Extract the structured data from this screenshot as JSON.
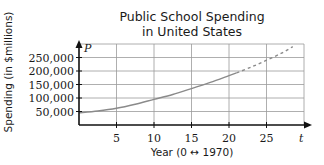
{
  "chart_data": {
    "type": "line",
    "title": "Public School Spending in United States",
    "title_lines": [
      "Public School Spending",
      "in United States"
    ],
    "xlabel": "Year (0 ↔ 1970)",
    "ylabel": "Spending (in $millions)",
    "x_var": "t",
    "y_var": "P",
    "xlim": [
      0,
      30
    ],
    "ylim": [
      0,
      300000
    ],
    "x_ticks": [
      5,
      10,
      15,
      20,
      25
    ],
    "x_tick_labels": [
      "5",
      "10",
      "15",
      "20",
      "25"
    ],
    "y_ticks": [
      50000,
      100000,
      150000,
      200000,
      250000
    ],
    "y_tick_labels": [
      "50,000",
      "100,000",
      "150,000",
      "200,000",
      "250,000"
    ],
    "grid": true,
    "legend": null,
    "series": [
      {
        "name": "Actual spending",
        "style": "solid",
        "color": "#8a8a8a",
        "x": [
          0,
          2.5,
          5,
          7.5,
          10,
          12.5,
          15,
          17.5,
          20,
          21
        ],
        "values": [
          45000,
          52000,
          62000,
          77000,
          95000,
          113000,
          135000,
          158000,
          183000,
          193000
        ]
      },
      {
        "name": "Projected spending",
        "style": "dashed",
        "color": "#8a8a8a",
        "x": [
          21,
          23,
          25,
          27,
          28.5
        ],
        "values": [
          193000,
          215000,
          240000,
          266000,
          290000
        ]
      }
    ]
  }
}
